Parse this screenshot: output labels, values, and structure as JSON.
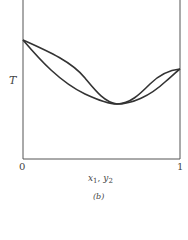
{
  "figure": {
    "caption": "(b)",
    "y_axis_label": "T",
    "x_axis_label": {
      "var1": "x",
      "sub1": "1",
      "sep": ", ",
      "var2": "y",
      "sub2": "2"
    },
    "x_ticks": [
      "0",
      "1"
    ]
  },
  "diagram": {
    "type": "phase-diagram",
    "curves": [
      {
        "name": "dew-curve",
        "role": "upper lens boundary"
      },
      {
        "name": "bubble-curve",
        "role": "lower lens boundary"
      }
    ],
    "azeotrope_x_fraction": 0.6,
    "line_color": "#333333"
  }
}
